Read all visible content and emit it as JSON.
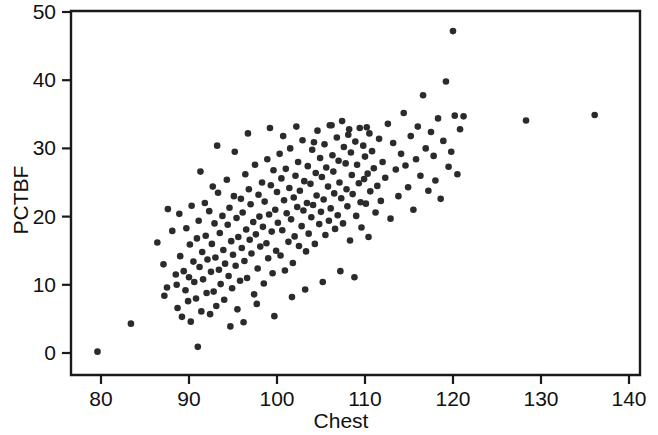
{
  "chart_data": {
    "type": "scatter",
    "title": "",
    "xlabel": "Chest",
    "ylabel": "PCTBF",
    "xlim": [
      71.2,
      143.2
    ],
    "ylim": [
      -2.0,
      53.2
    ],
    "xticks": [
      80,
      90,
      100,
      110,
      120,
      130,
      140
    ],
    "xtick_labels": [
      "80",
      "90",
      "100",
      "110",
      "120",
      "130",
      "140"
    ],
    "yticks": [
      0,
      10,
      20,
      30,
      40,
      50
    ],
    "ytick_labels": [
      "0",
      "10",
      "20",
      "30",
      "40",
      "50"
    ],
    "grid": false,
    "legend": null,
    "marker": {
      "shape": "circle",
      "size_px": 6.6,
      "color": "#2b2b2b"
    },
    "n_points": 249,
    "points": [
      [
        79.6,
        0.2
      ],
      [
        83.4,
        4.3
      ],
      [
        86.4,
        16.2
      ],
      [
        87.1,
        13.0
      ],
      [
        87.2,
        8.4
      ],
      [
        87.5,
        9.6
      ],
      [
        87.6,
        21.1
      ],
      [
        88.1,
        17.9
      ],
      [
        88.5,
        11.5
      ],
      [
        88.6,
        10.0
      ],
      [
        88.7,
        6.6
      ],
      [
        88.9,
        20.4
      ],
      [
        89.0,
        14.2
      ],
      [
        89.2,
        5.3
      ],
      [
        89.4,
        12.0
      ],
      [
        89.6,
        9.2
      ],
      [
        89.7,
        18.3
      ],
      [
        89.9,
        7.6
      ],
      [
        90.0,
        11.1
      ],
      [
        90.1,
        15.9
      ],
      [
        90.2,
        4.6
      ],
      [
        90.3,
        21.6
      ],
      [
        90.5,
        13.4
      ],
      [
        90.6,
        10.4
      ],
      [
        90.8,
        8.0
      ],
      [
        90.9,
        16.8
      ],
      [
        91.0,
        0.9
      ],
      [
        91.1,
        19.4
      ],
      [
        91.2,
        12.6
      ],
      [
        91.4,
        6.1
      ],
      [
        91.5,
        14.8
      ],
      [
        91.6,
        10.8
      ],
      [
        91.8,
        22.0
      ],
      [
        91.9,
        17.2
      ],
      [
        92.0,
        8.8
      ],
      [
        92.1,
        13.7
      ],
      [
        92.3,
        20.8
      ],
      [
        92.4,
        5.7
      ],
      [
        92.5,
        11.9
      ],
      [
        92.6,
        16.0
      ],
      [
        92.8,
        9.0
      ],
      [
        92.9,
        19.0
      ],
      [
        93.0,
        14.0
      ],
      [
        93.1,
        6.9
      ],
      [
        93.3,
        23.5
      ],
      [
        93.4,
        12.2
      ],
      [
        93.5,
        17.6
      ],
      [
        93.6,
        10.1
      ],
      [
        93.8,
        20.1
      ],
      [
        93.9,
        15.1
      ],
      [
        94.0,
        7.8
      ],
      [
        94.1,
        13.1
      ],
      [
        94.3,
        25.4
      ],
      [
        94.4,
        18.8
      ],
      [
        94.5,
        11.3
      ],
      [
        94.6,
        21.3
      ],
      [
        94.8,
        16.4
      ],
      [
        94.9,
        9.5
      ],
      [
        95.0,
        14.4
      ],
      [
        95.1,
        23.0
      ],
      [
        95.3,
        12.8
      ],
      [
        95.4,
        19.8
      ],
      [
        95.5,
        6.4
      ],
      [
        95.6,
        17.0
      ],
      [
        95.8,
        10.6
      ],
      [
        95.9,
        22.6
      ],
      [
        96.0,
        15.4
      ],
      [
        96.1,
        20.6
      ],
      [
        96.3,
        13.5
      ],
      [
        96.4,
        26.2
      ],
      [
        96.5,
        18.1
      ],
      [
        96.6,
        11.0
      ],
      [
        96.8,
        24.0
      ],
      [
        96.9,
        16.6
      ],
      [
        97.0,
        21.8
      ],
      [
        97.1,
        14.6
      ],
      [
        97.3,
        19.2
      ],
      [
        97.4,
        8.6
      ],
      [
        97.5,
        27.6
      ],
      [
        97.6,
        17.4
      ],
      [
        97.8,
        12.4
      ],
      [
        97.9,
        23.2
      ],
      [
        98.0,
        20.0
      ],
      [
        98.1,
        15.6
      ],
      [
        98.3,
        25.0
      ],
      [
        98.4,
        18.5
      ],
      [
        98.5,
        10.2
      ],
      [
        98.6,
        22.2
      ],
      [
        98.8,
        16.1
      ],
      [
        98.9,
        28.4
      ],
      [
        99.0,
        13.9
      ],
      [
        99.1,
        20.3
      ],
      [
        99.3,
        24.6
      ],
      [
        99.4,
        17.8
      ],
      [
        99.5,
        11.7
      ],
      [
        99.6,
        26.8
      ],
      [
        99.8,
        21.0
      ],
      [
        99.9,
        15.0
      ],
      [
        100.0,
        23.6
      ],
      [
        100.1,
        19.1
      ],
      [
        100.3,
        29.2
      ],
      [
        100.4,
        14.3
      ],
      [
        100.5,
        25.6
      ],
      [
        100.6,
        18.0
      ],
      [
        100.8,
        22.4
      ],
      [
        100.9,
        12.1
      ],
      [
        101.0,
        27.0
      ],
      [
        101.1,
        20.5
      ],
      [
        101.3,
        16.3
      ],
      [
        101.4,
        24.2
      ],
      [
        101.5,
        30.0
      ],
      [
        101.6,
        19.6
      ],
      [
        101.8,
        13.2
      ],
      [
        101.9,
        22.8
      ],
      [
        102.0,
        17.1
      ],
      [
        102.1,
        26.0
      ],
      [
        102.3,
        21.4
      ],
      [
        102.4,
        28.0
      ],
      [
        102.5,
        15.7
      ],
      [
        102.6,
        23.8
      ],
      [
        102.8,
        18.6
      ],
      [
        102.9,
        31.2
      ],
      [
        103.0,
        20.9
      ],
      [
        103.1,
        25.2
      ],
      [
        103.3,
        14.9
      ],
      [
        103.4,
        22.0
      ],
      [
        103.5,
        27.4
      ],
      [
        103.6,
        17.5
      ],
      [
        103.8,
        24.8
      ],
      [
        103.9,
        19.9
      ],
      [
        104.0,
        29.8
      ],
      [
        104.1,
        21.7
      ],
      [
        104.3,
        16.0
      ],
      [
        104.4,
        26.4
      ],
      [
        104.5,
        23.1
      ],
      [
        104.6,
        32.6
      ],
      [
        104.8,
        18.9
      ],
      [
        104.9,
        28.6
      ],
      [
        105.0,
        20.7
      ],
      [
        105.1,
        25.8
      ],
      [
        105.3,
        22.5
      ],
      [
        105.4,
        30.6
      ],
      [
        105.5,
        17.3
      ],
      [
        105.6,
        27.2
      ],
      [
        105.8,
        24.4
      ],
      [
        105.9,
        19.4
      ],
      [
        106.0,
        33.4
      ],
      [
        106.1,
        21.2
      ],
      [
        106.3,
        29.0
      ],
      [
        106.4,
        26.6
      ],
      [
        106.5,
        23.4
      ],
      [
        106.6,
        18.2
      ],
      [
        106.8,
        31.6
      ],
      [
        106.9,
        20.2
      ],
      [
        107.0,
        28.2
      ],
      [
        107.1,
        25.0
      ],
      [
        107.3,
        22.7
      ],
      [
        107.4,
        34.0
      ],
      [
        107.5,
        19.0
      ],
      [
        107.6,
        30.2
      ],
      [
        107.8,
        27.8
      ],
      [
        107.9,
        24.0
      ],
      [
        108.0,
        21.5
      ],
      [
        108.1,
        32.0
      ],
      [
        108.3,
        16.5
      ],
      [
        108.4,
        29.4
      ],
      [
        108.5,
        26.1
      ],
      [
        108.6,
        23.3
      ],
      [
        108.8,
        11.1
      ],
      [
        108.9,
        31.0
      ],
      [
        109.0,
        20.1
      ],
      [
        109.1,
        27.6
      ],
      [
        109.3,
        24.9
      ],
      [
        109.4,
        33.0
      ],
      [
        109.5,
        22.1
      ],
      [
        109.6,
        18.4
      ],
      [
        109.8,
        30.4
      ],
      [
        109.9,
        25.5
      ],
      [
        110.0,
        28.8
      ],
      [
        110.1,
        21.9
      ],
      [
        110.3,
        26.3
      ],
      [
        110.4,
        17.0
      ],
      [
        110.5,
        32.2
      ],
      [
        110.6,
        23.7
      ],
      [
        110.8,
        29.6
      ],
      [
        111.0,
        27.1
      ],
      [
        111.2,
        20.6
      ],
      [
        111.4,
        24.5
      ],
      [
        111.6,
        31.4
      ],
      [
        111.8,
        22.3
      ],
      [
        112.0,
        28.0
      ],
      [
        112.3,
        25.7
      ],
      [
        112.6,
        33.6
      ],
      [
        112.9,
        19.7
      ],
      [
        113.2,
        30.8
      ],
      [
        113.5,
        26.9
      ],
      [
        113.8,
        23.0
      ],
      [
        114.1,
        29.2
      ],
      [
        114.4,
        35.2
      ],
      [
        114.6,
        27.5
      ],
      [
        114.9,
        24.3
      ],
      [
        115.2,
        31.8
      ],
      [
        115.5,
        21.0
      ],
      [
        115.8,
        28.4
      ],
      [
        116.0,
        33.2
      ],
      [
        116.3,
        26.0
      ],
      [
        116.6,
        37.8
      ],
      [
        116.9,
        30.0
      ],
      [
        117.2,
        23.8
      ],
      [
        117.5,
        32.4
      ],
      [
        117.8,
        28.9
      ],
      [
        118.0,
        25.3
      ],
      [
        118.3,
        34.4
      ],
      [
        118.6,
        22.6
      ],
      [
        118.9,
        31.1
      ],
      [
        119.2,
        39.8
      ],
      [
        119.5,
        27.3
      ],
      [
        119.8,
        29.5
      ],
      [
        120.0,
        47.2
      ],
      [
        120.2,
        34.8
      ],
      [
        120.5,
        26.2
      ],
      [
        120.8,
        32.8
      ],
      [
        121.2,
        34.7
      ],
      [
        128.3,
        34.1
      ],
      [
        136.1,
        34.9
      ],
      [
        93.2,
        30.4
      ],
      [
        95.2,
        29.5
      ],
      [
        96.7,
        32.2
      ],
      [
        99.2,
        33.0
      ],
      [
        100.7,
        31.8
      ],
      [
        102.2,
        33.2
      ],
      [
        104.2,
        30.9
      ],
      [
        106.2,
        33.4
      ],
      [
        108.2,
        32.8
      ],
      [
        110.2,
        33.1
      ],
      [
        94.7,
        3.9
      ],
      [
        96.2,
        4.5
      ],
      [
        97.7,
        7.2
      ],
      [
        99.7,
        5.4
      ],
      [
        101.7,
        8.2
      ],
      [
        103.2,
        9.3
      ],
      [
        105.2,
        10.4
      ],
      [
        107.2,
        12.0
      ],
      [
        91.3,
        26.6
      ],
      [
        92.7,
        24.4
      ]
    ]
  },
  "axes": {
    "x_title": "Chest",
    "y_title": "PCTBF"
  }
}
